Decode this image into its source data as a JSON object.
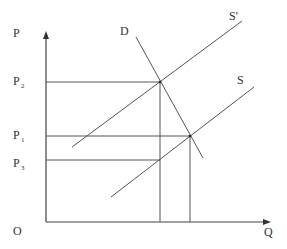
{
  "diagram": {
    "axes": {
      "y_label": "P",
      "x_label": "Q",
      "origin_label": "O"
    },
    "price_labels": [
      {
        "id": "p2",
        "main": "P",
        "sub": "2",
        "y": 82
      },
      {
        "id": "p1",
        "main": "P",
        "sub": "1",
        "y": 136
      },
      {
        "id": "p3",
        "main": "P",
        "sub": "3",
        "y": 160
      }
    ],
    "curves": [
      {
        "id": "demand",
        "label": "D"
      },
      {
        "id": "supply-shifted",
        "label": "S'"
      },
      {
        "id": "supply",
        "label": "S"
      }
    ],
    "colors": {
      "line": "#555555",
      "text": "#333333",
      "background": "#ffffff"
    }
  }
}
